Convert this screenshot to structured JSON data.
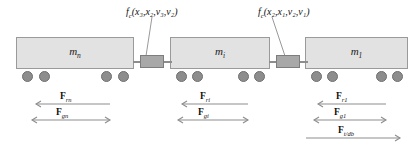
{
  "diagram": {
    "background_color": "#ffffff",
    "body_fill": "#e2e2e2",
    "body_stroke": "#9a9a9a",
    "wheel_fill": "#8d8d8d",
    "coupler_fill": "#a8a8a8",
    "arrow_color": "#8d8d8d",
    "text_color": "#111111"
  },
  "cars": [
    {
      "id": "car-n",
      "mass_label": "m",
      "mass_sub": "n",
      "x": 16,
      "y": 37,
      "width": 118,
      "height": 32
    },
    {
      "id": "car-i",
      "mass_label": "m",
      "mass_sub": "i",
      "x": 170,
      "y": 37,
      "width": 100,
      "height": 32
    },
    {
      "id": "car-1",
      "mass_label": "m",
      "mass_sub": "1",
      "x": 305,
      "y": 37,
      "width": 103,
      "height": 32
    }
  ],
  "wheels": [
    {
      "cx": 27,
      "cy": 76
    },
    {
      "cx": 44,
      "cy": 76
    },
    {
      "cx": 106,
      "cy": 76
    },
    {
      "cx": 123,
      "cy": 76
    },
    {
      "cx": 181,
      "cy": 76
    },
    {
      "cx": 197,
      "cy": 76
    },
    {
      "cx": 243,
      "cy": 76
    },
    {
      "cx": 259,
      "cy": 76
    },
    {
      "cx": 316,
      "cy": 76
    },
    {
      "cx": 332,
      "cy": 76
    },
    {
      "cx": 381,
      "cy": 76
    },
    {
      "cx": 397,
      "cy": 76
    }
  ],
  "couplers": [
    {
      "id": "coupler-3-2",
      "x": 140,
      "y": 55,
      "width": 24,
      "height": 13,
      "rod_left_x": 133,
      "rod_right_x": 164,
      "rod_y": 61,
      "rod_len": 8
    },
    {
      "id": "coupler-2-1",
      "x": 276,
      "y": 55,
      "width": 24,
      "height": 13,
      "rod_left_x": 269,
      "rod_right_x": 300,
      "rod_y": 61,
      "rod_len": 8
    }
  ],
  "coupling_forces": [
    {
      "id": "fc-3-2",
      "symbol": "f",
      "symbol_sub": "c",
      "args": "(x₃,x₂,v₃,v₂)",
      "text": "f",
      "label_x": 126,
      "label_y": 7,
      "leader_x1": 152,
      "leader_y1": 17,
      "leader_x2": 146,
      "leader_y2": 56
    },
    {
      "id": "fc-2-1",
      "symbol": "f",
      "symbol_sub": "c",
      "args": "(x₂,x₁,v₂,v₁)",
      "text": "f",
      "label_x": 258,
      "label_y": 7,
      "leader_x1": 272,
      "leader_y1": 17,
      "leader_x2": 285,
      "leader_y2": 56
    }
  ],
  "force_arrows": [
    {
      "id": "force-rn",
      "symbol": "F",
      "sub": "rn",
      "direction": "left",
      "x1": 36,
      "x2": 110,
      "y": 104,
      "label_x": 60,
      "label_y": 92
    },
    {
      "id": "force-gn",
      "symbol": "F",
      "sub": "gn",
      "direction": "both",
      "x1": 32,
      "x2": 110,
      "y": 120,
      "label_x": 56,
      "label_y": 108
    },
    {
      "id": "force-ri",
      "symbol": "F",
      "sub": "ri",
      "direction": "left",
      "x1": 182,
      "x2": 248,
      "y": 104,
      "label_x": 200,
      "label_y": 92
    },
    {
      "id": "force-gi",
      "symbol": "F",
      "sub": "gi",
      "direction": "both",
      "x1": 178,
      "x2": 248,
      "y": 120,
      "label_x": 198,
      "label_y": 108
    },
    {
      "id": "force-r1",
      "symbol": "F",
      "sub": "r1",
      "direction": "left",
      "x1": 318,
      "x2": 386,
      "y": 104,
      "label_x": 336,
      "label_y": 92
    },
    {
      "id": "force-g1",
      "symbol": "F",
      "sub": "g1",
      "direction": "both",
      "x1": 314,
      "x2": 386,
      "y": 120,
      "label_x": 334,
      "label_y": 108
    },
    {
      "id": "force-t-db",
      "symbol": "F",
      "sub": "t/db",
      "direction": "right",
      "x1": 306,
      "x2": 400,
      "y": 138,
      "label_x": 338,
      "label_y": 126
    }
  ]
}
